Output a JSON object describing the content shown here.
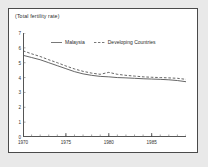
{
  "figure": {
    "title": "(Total fertility rate)"
  },
  "chart_data": {
    "type": "line",
    "title": "(Total fertility rate)",
    "xlabel": "",
    "ylabel": "Total fertility rate",
    "xlim": [
      1970,
      1989
    ],
    "ylim": [
      0,
      7
    ],
    "grid": false,
    "legend_position": "top-center",
    "y_ticks": [
      "0",
      "1",
      "2",
      "3",
      "4",
      "5",
      "6",
      "7"
    ],
    "y_tick_values": [
      0,
      1,
      2,
      3,
      4,
      5,
      6,
      7
    ],
    "x_ticks": [
      "1970",
      "1975",
      "1980",
      "1985"
    ],
    "x_tick_values": [
      1970,
      1975,
      1980,
      1985
    ],
    "x": [
      1970,
      1971,
      1972,
      1973,
      1974,
      1975,
      1976,
      1977,
      1978,
      1979,
      1980,
      1981,
      1982,
      1983,
      1984,
      1985,
      1986,
      1987,
      1988,
      1989
    ],
    "series": [
      {
        "name": "Malaysia",
        "style": "solid",
        "color": "#555555",
        "values": [
          5.5,
          5.35,
          5.2,
          5.0,
          4.8,
          4.6,
          4.4,
          4.25,
          4.15,
          4.08,
          4.05,
          4.0,
          3.98,
          3.95,
          3.92,
          3.9,
          3.88,
          3.85,
          3.8,
          3.72
        ]
      },
      {
        "name": "Developing Countries",
        "style": "dashed",
        "color": "#555555",
        "values": [
          5.8,
          5.6,
          5.42,
          5.2,
          5.0,
          4.78,
          4.58,
          4.42,
          4.3,
          4.22,
          4.35,
          4.22,
          4.15,
          4.1,
          4.05,
          4.02,
          4.0,
          3.98,
          3.95,
          3.88
        ]
      }
    ]
  },
  "legend": {
    "items": [
      {
        "label": "Malaysia"
      },
      {
        "label": "Developing Countries"
      }
    ]
  }
}
